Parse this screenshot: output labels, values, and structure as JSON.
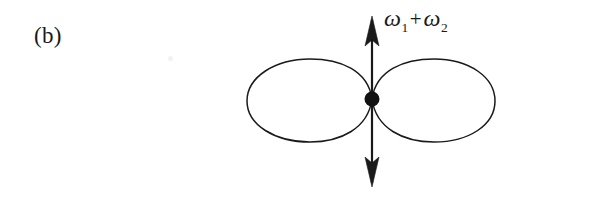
{
  "figure": {
    "panel_label": "(b)",
    "background_color": "#ffffff",
    "ink_color": "#1a1a1a",
    "mode_label": {
      "first_symbol": "ω",
      "first_subscript": "1",
      "operator": "+",
      "second_symbol": "ω",
      "second_subscript": "2",
      "full_text": "ω₁ + ω₂"
    },
    "geometry": {
      "node_x": 372,
      "node_y": 99,
      "node_radius": 7.5,
      "left_lobe_left_x": 247,
      "right_lobe_right_x": 495,
      "lobe_top_y": 60,
      "lobe_bottom_y": 142,
      "arrow_top_tip_y": 16,
      "arrow_bottom_tip_y": 187,
      "arrow_x": 372,
      "curve_stroke_width": 1.5,
      "arrow_shaft_width": 2.2
    },
    "elements": {
      "left_lobe_name": "left-lobe",
      "right_lobe_name": "right-lobe",
      "node_name": "center-node",
      "arrow_name": "vertical-double-arrow"
    }
  }
}
